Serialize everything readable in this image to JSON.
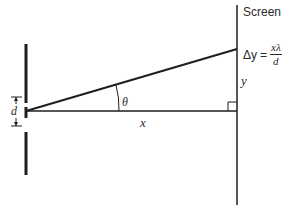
{
  "diagram": {
    "type": "double-slit interference geometry",
    "screen_label": "Screen",
    "formula": {
      "lhs": "Δy",
      "equals": "=",
      "numerator": "xλ",
      "denominator": "d"
    },
    "labels": {
      "y": "y",
      "theta": "θ",
      "x": "x",
      "d": "d"
    },
    "colors": {
      "line": "#1e1e1e",
      "text": "#2a2a2a",
      "background": "#ffffff"
    }
  }
}
